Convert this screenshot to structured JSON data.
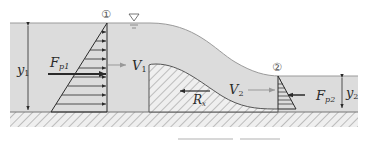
{
  "diagram": {
    "colors": {
      "water": "#dcdcdc",
      "water_surface": "#9a9a9a",
      "hatch": "#8a8a8a",
      "hatch_bg": "#eeeeee",
      "line": "#2a2a2a",
      "velocity_arrow": "#999999"
    },
    "labels": {
      "section1": "①",
      "section2": "②",
      "free_surface_symbol": "▽",
      "y1_main": "y",
      "y1_sub": "1",
      "y2_main": "y",
      "y2_sub": "2",
      "fp1_main": "F",
      "fp1_sub": "p1",
      "fp2_main": "F",
      "fp2_sub": "p2",
      "v1_main": "V",
      "v1_sub": "1",
      "v2_main": "V",
      "v2_sub": "2",
      "rx_main": "R",
      "rx_sub": "x"
    }
  }
}
